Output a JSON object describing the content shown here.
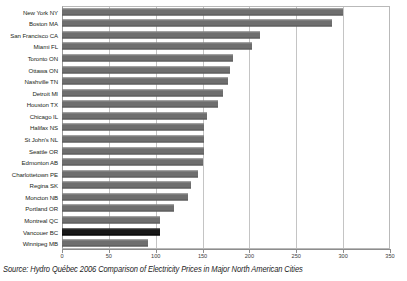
{
  "caption": "Source: Hydro Québec 2006 Comparison of Electricity Prices in Major North American Cities",
  "chart_data": {
    "type": "bar",
    "orientation": "horizontal",
    "title": "",
    "xlabel": "",
    "ylabel": "",
    "xlim": [
      0,
      350
    ],
    "xticks": [
      0,
      50,
      100,
      150,
      200,
      250,
      300,
      350
    ],
    "grid": true,
    "legend": "none",
    "highlight_category": "Vancouer BC",
    "bar_color": "#6e6e6e",
    "highlight_color": "#171717",
    "categories": [
      "New York NY",
      "Boston MA",
      "San Francisco CA",
      "Miami FL",
      "Toronto ON",
      "Ottawa ON",
      "Nashville TN",
      "Detroit MI",
      "Houston TX",
      "Chicago IL",
      "Halifax NS",
      "St John's NL",
      "Seattle OR",
      "Edmonton AB",
      "Charlottetown PE",
      "Regina SK",
      "Moncton NB",
      "Portland OR",
      "Montreal QC",
      "Vancouer BC",
      "Winnipeg MB"
    ],
    "values": [
      300,
      288,
      211,
      203,
      182,
      179,
      177,
      172,
      166,
      155,
      152,
      152,
      152,
      150,
      145,
      138,
      134,
      120,
      105,
      105,
      92
    ]
  }
}
